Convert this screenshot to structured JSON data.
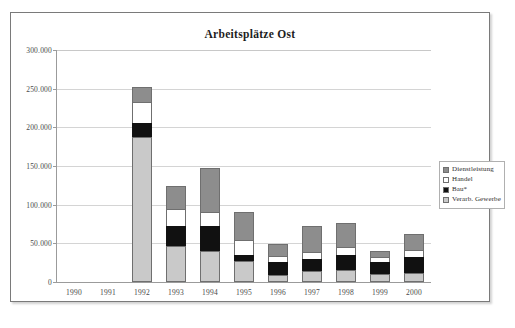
{
  "chart_data": {
    "type": "bar",
    "subtype": "stacked-column",
    "title": "Arbeitsplätze Ost",
    "xlabel": "",
    "ylabel": "",
    "ylim": [
      0,
      300000
    ],
    "ytick_step": 50000,
    "ytick_labels": [
      "300.000",
      "250.000",
      "200.000",
      "150.000",
      "100.000",
      "50.000",
      "0"
    ],
    "ytick_values": [
      300000,
      250000,
      200000,
      150000,
      100000,
      50000,
      0
    ],
    "grid": true,
    "legend_position": "right",
    "categories": [
      "1990",
      "1991",
      "1992",
      "1993",
      "1994",
      "1995",
      "1996",
      "1997",
      "1998",
      "1999",
      "2000"
    ],
    "series": [
      {
        "name": "Verarb. Gewerbe",
        "color": "#c9c9c9",
        "values": [
          0,
          0,
          187000,
          46000,
          40000,
          27000,
          9000,
          14000,
          16000,
          11000,
          12000
        ]
      },
      {
        "name": "Bau*",
        "color": "#111111",
        "values": [
          0,
          0,
          19000,
          27000,
          32000,
          8000,
          17000,
          16000,
          19000,
          15000,
          21000
        ]
      },
      {
        "name": "Handel",
        "color": "#ffffff",
        "values": [
          0,
          0,
          27000,
          21000,
          18000,
          19000,
          8000,
          9000,
          10000,
          6000,
          8000
        ]
      },
      {
        "name": "Dienstleistung",
        "color": "#8d8d8d",
        "values": [
          0,
          0,
          19000,
          30000,
          58000,
          37000,
          15000,
          33000,
          31000,
          8000,
          21000
        ]
      }
    ],
    "totals": [
      0,
      0,
      252000,
      124000,
      148000,
      91000,
      49000,
      72000,
      76000,
      40000,
      62000
    ]
  },
  "legend": {
    "items": [
      {
        "label": "Dienstleistung",
        "swatch": "dienstleistung"
      },
      {
        "label": "Handel",
        "swatch": "handel"
      },
      {
        "label": "Bau*",
        "swatch": "bau"
      },
      {
        "label": "Verarb. Gewerbe",
        "swatch": "verarb"
      }
    ]
  }
}
